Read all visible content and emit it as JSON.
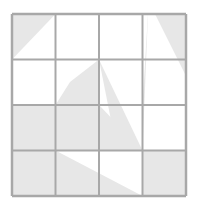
{
  "figure": {
    "type": "geometric-grid-shading",
    "canvas": {
      "width": 198,
      "height": 212,
      "background": "#ffffff"
    },
    "grid": {
      "rows": 4,
      "cols": 4,
      "x0": 12,
      "y0": 14,
      "x1": 186,
      "y1": 196,
      "x_lines": [
        12,
        55.5,
        99,
        142.5,
        186
      ],
      "y_lines": [
        14,
        59.5,
        105,
        150.5,
        196
      ],
      "line_color": "#a8a8a8",
      "line_width": 2,
      "outer_line_color": "#a8a8a8",
      "outer_line_width": 2.5
    },
    "colors": {
      "shade": "#e7e7e7",
      "shade_light": "#ededed",
      "background": "#ffffff",
      "grid_line": "#a8a8a8"
    },
    "shapes": [
      {
        "name": "top-left-corner-triangle",
        "kind": "polygon",
        "fill": "#e7e7e7",
        "points": "12,14 55.5,14 12,59.5",
        "description": "Gray triangle occupying the upper-left half of cell row1 col1"
      },
      {
        "name": "upper-right-block-with-white-wedge",
        "kind": "polygon",
        "fill": "#e7e7e7",
        "points": "99,14 186,14 186,150.5 142.5,150.5 142.5,105 148,14",
        "description": "Large gray region covering cells row1 col3-col4 and row2-row3 col4, pierced by a white wedge"
      },
      {
        "name": "white-wedge-upper-right",
        "kind": "polygon",
        "fill": "#ffffff",
        "points": "148,14 142.5,150.5 186,150.5 186,76 155,14",
        "description": "White triangular wedge widening downward through the right columns"
      },
      {
        "name": "central-down-left-fan",
        "kind": "polygon",
        "fill": "#e7e7e7",
        "points": "99,59.5 99,105 55.5,105 70,82",
        "description": "Gray triangle below-left of the central grid intersection in row2 col2"
      },
      {
        "name": "central-down-right-fan",
        "kind": "polygon",
        "fill": "#e7e7e7",
        "points": "99,59.5 142.5,150.5 117,150.5",
        "description": "Narrow gray triangle descending right from the central intersection"
      },
      {
        "name": "row3-left-sweep",
        "kind": "polygon",
        "fill": "#e7e7e7",
        "points": "12,105 99,105 142.5,150.5 12,150.5",
        "description": "Gray sweep across row3 columns 1-3 bounded by a diagonal"
      },
      {
        "name": "row4-left-sweep",
        "kind": "polygon",
        "fill": "#e7e7e7",
        "points": "12,150.5 12,196 142.5,196 55.5,150.5",
        "description": "Gray sweep across row4 columns 1-3 under a diagonal"
      },
      {
        "name": "row4-col4-square",
        "kind": "polygon",
        "fill": "#e7e7e7",
        "points": "142.5,150.5 186,150.5 186,196 142.5,196",
        "description": "Fully gray cell at row4 column4"
      }
    ],
    "cells": [
      {
        "row": 1,
        "col": 1,
        "name": "cell-r1c1",
        "state": "half-shaded-upper-left"
      },
      {
        "row": 1,
        "col": 2,
        "name": "cell-r1c2",
        "state": "empty"
      },
      {
        "row": 1,
        "col": 3,
        "name": "cell-r1c3",
        "state": "shaded"
      },
      {
        "row": 1,
        "col": 4,
        "name": "cell-r1c4",
        "state": "partial-shaded"
      },
      {
        "row": 2,
        "col": 1,
        "name": "cell-r2c1",
        "state": "empty"
      },
      {
        "row": 2,
        "col": 2,
        "name": "cell-r2c2",
        "state": "partial-shaded"
      },
      {
        "row": 2,
        "col": 3,
        "name": "cell-r2c3",
        "state": "partial-shaded"
      },
      {
        "row": 2,
        "col": 4,
        "name": "cell-r2c4",
        "state": "partial-shaded"
      },
      {
        "row": 3,
        "col": 1,
        "name": "cell-r3c1",
        "state": "shaded"
      },
      {
        "row": 3,
        "col": 2,
        "name": "cell-r3c2",
        "state": "partial-shaded"
      },
      {
        "row": 3,
        "col": 3,
        "name": "cell-r3c3",
        "state": "partial-shaded"
      },
      {
        "row": 3,
        "col": 4,
        "name": "cell-r3c4",
        "state": "partial-shaded"
      },
      {
        "row": 4,
        "col": 1,
        "name": "cell-r4c1",
        "state": "partial-shaded"
      },
      {
        "row": 4,
        "col": 2,
        "name": "cell-r4c2",
        "state": "partial-shaded"
      },
      {
        "row": 4,
        "col": 3,
        "name": "cell-r4c3",
        "state": "partial-shaded"
      },
      {
        "row": 4,
        "col": 4,
        "name": "cell-r4c4",
        "state": "shaded"
      }
    ]
  }
}
